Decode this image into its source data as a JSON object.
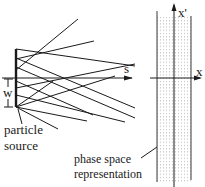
{
  "source": {
    "label_line1": "particle",
    "label_line2": "source",
    "width_label": "w"
  },
  "beam_axis": {
    "label": "s"
  },
  "phase_space": {
    "x_axis_label": "x",
    "y_axis_label": "x'",
    "caption_line1": "phase space",
    "caption_line2": "representation"
  },
  "colors": {
    "line": "#1a1a1a",
    "dots": "#9a9a9a",
    "background": "#ffffff"
  }
}
